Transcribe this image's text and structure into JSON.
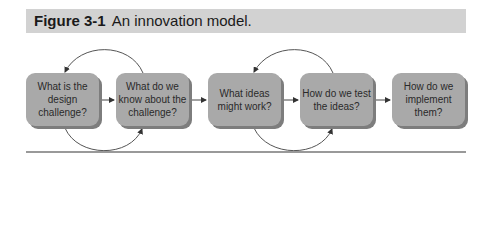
{
  "figure": {
    "number": "Figure 3-1",
    "title": "An innovation model."
  },
  "diagram": {
    "type": "flow",
    "steps": [
      {
        "label": "What is the design challenge?"
      },
      {
        "label": "What do we know about the challenge?"
      },
      {
        "label": "What ideas might work?"
      },
      {
        "label": "How do we test the ideas?"
      },
      {
        "label": "How do we implement them?"
      }
    ],
    "loops": [
      {
        "between": [
          1,
          2
        ]
      },
      {
        "between": [
          3,
          4
        ]
      }
    ],
    "colors": {
      "box": "#a9a9a9",
      "shadow": "#7d7d7d",
      "caption_bg": "#d2d2d2"
    }
  }
}
